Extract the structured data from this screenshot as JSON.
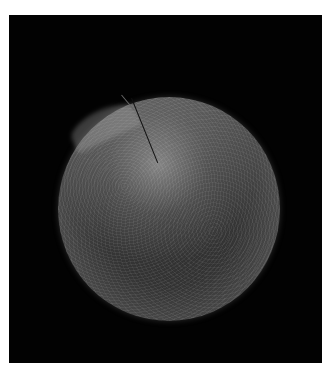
{
  "image": {
    "subject": "scanning electron micrograph of a spherical cell",
    "description": "Textured grey sphere on black background with a thin strand crossing its upper surface",
    "colors": {
      "background": "#020202",
      "page": "#ffffff",
      "sphere_highlight": "#c8c8c8",
      "sphere_shadow": "#2a2a2a"
    }
  }
}
